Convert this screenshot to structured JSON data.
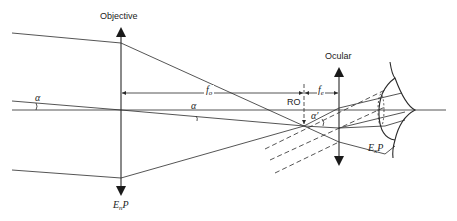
{
  "diagram": {
    "type": "optical-ray-diagram",
    "labels": {
      "objective": "Objective",
      "ocular": "Ocular",
      "entrance_pupil_main": "E",
      "entrance_pupil_sub": "n",
      "entrance_pupil_tail": "P",
      "exit_pupil_main": "E",
      "exit_pupil_sub": "x",
      "exit_pupil_tail": "P",
      "focal_objective_main": "f",
      "focal_objective_sub": "o",
      "focal_ocular_main": "f",
      "focal_ocular_sub": "e",
      "ro": "RO",
      "alpha_left": "α",
      "alpha_center": "α",
      "alpha_prime": "α′"
    },
    "elements": [
      {
        "name": "objective-lens",
        "x": 121,
        "y_top": 27,
        "y_bottom": 195
      },
      {
        "name": "ocular-lens",
        "x": 339,
        "y_top": 67,
        "y_bottom": 165
      },
      {
        "name": "optical-axis",
        "y": 110
      },
      {
        "name": "eye",
        "x_range": [
          380,
          446
        ]
      }
    ],
    "colors": {
      "line": "#2a2a2a",
      "background": "#ffffff"
    }
  }
}
